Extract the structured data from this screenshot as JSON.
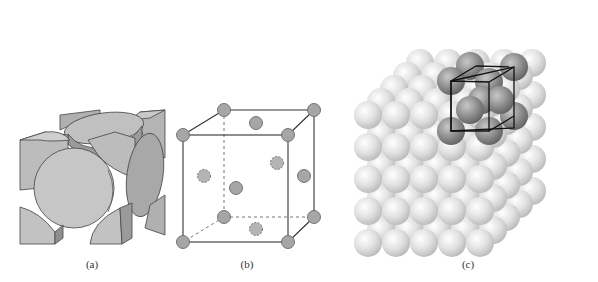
{
  "figure": {
    "panels": [
      {
        "id": "a",
        "label": "(a)",
        "description": "Hard-sphere unit cell (sectioned atoms)"
      },
      {
        "id": "b",
        "label": "(b)",
        "description": "Reduced-sphere unit cell with corner and face-center atoms"
      },
      {
        "id": "c",
        "label": "(c)",
        "description": "Aggregate of many atoms with highlighted unit cell"
      }
    ]
  },
  "colors": {
    "atom_fill": "#a8a8a8",
    "atom_stroke": "#6a6a6a",
    "cube_edge": "#333333",
    "light_sphere": "#e6e6e6",
    "dark_sphere": "#8a8a8a"
  }
}
